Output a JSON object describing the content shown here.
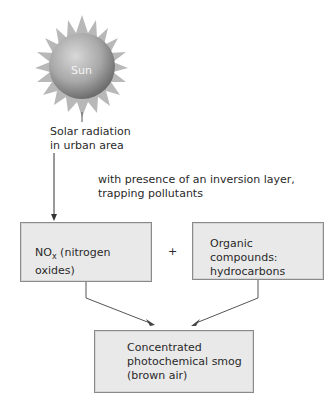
{
  "sun": {
    "label": "Sun"
  },
  "solar": {
    "line1": "Solar radiation",
    "line2": "in urban area"
  },
  "inversion": {
    "line1": "with presence of an inversion layer,",
    "line2": "trapping pollutants"
  },
  "nox_box": {
    "main": "NO",
    "sub": "x",
    "rest": " (nitrogen oxides)"
  },
  "plus": "+",
  "organic_box": {
    "line1": "Organic compounds:",
    "line2": "hydrocarbons"
  },
  "smog_box": {
    "line1": "Concentrated",
    "line2": "photochemical smog",
    "line3": "(brown air)"
  },
  "colors": {
    "box_fill": "#e9e9e9",
    "box_border": "#8a8a8a",
    "sun_light": "#cfcfcf",
    "sun_dark": "#6e6e6e"
  }
}
